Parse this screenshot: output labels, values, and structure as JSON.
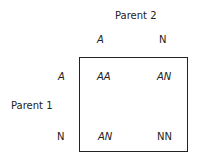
{
  "diagram": {
    "type": "punnett-square",
    "parent2_label": "Parent 2",
    "parent1_label": "Parent 1",
    "parent2_alleles": [
      {
        "label": "A",
        "italic": true
      },
      {
        "label": "N",
        "italic": false
      }
    ],
    "parent1_alleles": [
      {
        "label": "A",
        "italic": true
      },
      {
        "label": "N",
        "italic": false
      }
    ],
    "cells": [
      [
        {
          "label": "AA",
          "italic": true
        },
        {
          "label": "AN",
          "italic": true
        }
      ],
      [
        {
          "label": "AN",
          "italic": true
        },
        {
          "label": "NN",
          "italic": false
        }
      ]
    ]
  }
}
